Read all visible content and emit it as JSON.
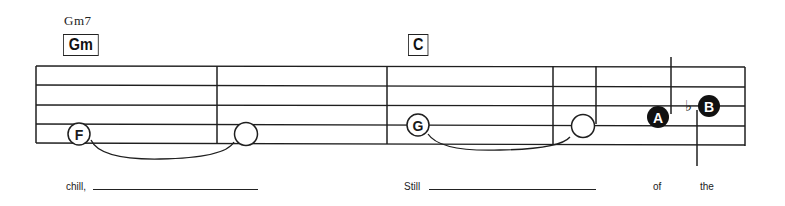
{
  "chords": [
    {
      "name": "Gm7",
      "box_label": "Gm"
    },
    {
      "name": "",
      "box_label": "C"
    }
  ],
  "notes": [
    {
      "letter": "F",
      "style": "outlined-letter",
      "duration": "whole",
      "tied_to_next": true
    },
    {
      "letter": "",
      "style": "open",
      "duration": "whole",
      "tied_from_prev": true
    },
    {
      "letter": "G",
      "style": "outlined-letter",
      "duration": "whole",
      "tied_to_next": true
    },
    {
      "letter": "",
      "style": "open-stemmed",
      "duration": "half",
      "tied_from_prev": true
    },
    {
      "letter": "A",
      "style": "filled",
      "duration": "quarter"
    },
    {
      "letter": "B",
      "style": "filled",
      "accidental": "♭",
      "duration": "quarter"
    }
  ],
  "lyrics": [
    {
      "text": "chill,",
      "blank": true
    },
    {
      "text": "Still",
      "blank": true
    },
    {
      "text": "of",
      "blank": false
    },
    {
      "text": "the",
      "blank": false
    }
  ],
  "symbols": {
    "flat": "♭"
  },
  "colors": {
    "ink": "#1a1a1a",
    "paper": "#ffffff"
  }
}
